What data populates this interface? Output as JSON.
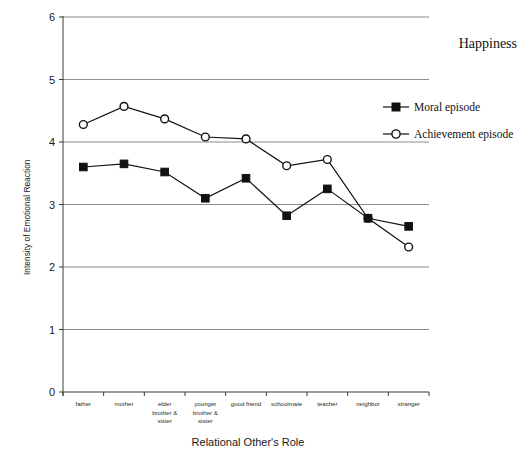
{
  "chart_data": {
    "type": "line",
    "title": "Happiness",
    "xlabel": "Relational Other's Role",
    "ylabel": "Intensity of Emotional Reaction",
    "ylim": [
      0,
      6
    ],
    "yticks": [
      0,
      1,
      2,
      3,
      4,
      5,
      6
    ],
    "grid": true,
    "legend_position": "top-right",
    "categories": [
      "father",
      "elder\nbrother &\nsister",
      "mother",
      "younger\nbrother &\nsister",
      "good friend",
      "schoolmate",
      "teacher",
      "neighbor",
      "stranger"
    ],
    "categories_display": [
      [
        "father"
      ],
      [
        "mother"
      ],
      [
        "elder",
        "brother &",
        "sister"
      ],
      [
        "younger",
        "brother &",
        "sister"
      ],
      [
        "good friend"
      ],
      [
        "schoolmate"
      ],
      [
        "teacher"
      ],
      [
        "neighbor"
      ],
      [
        "stranger"
      ]
    ],
    "series": [
      {
        "name": "Moral episode",
        "marker": "filled-square",
        "values": [
          3.6,
          3.65,
          3.52,
          3.1,
          3.42,
          2.82,
          3.25,
          2.78,
          2.65
        ]
      },
      {
        "name": "Achievement episode",
        "marker": "open-circle",
        "values": [
          4.28,
          4.57,
          4.37,
          4.08,
          4.05,
          3.62,
          3.72,
          2.78,
          2.32
        ]
      }
    ]
  },
  "legend": {
    "items": [
      {
        "label": "Moral episode",
        "marker": "filled-square"
      },
      {
        "label": "Achievement episode",
        "marker": "open-circle"
      }
    ]
  },
  "colors": {
    "ink": "#111111",
    "grid": "#8c8c8c",
    "axis": "#3a3a3a",
    "background": "#ffffff"
  }
}
